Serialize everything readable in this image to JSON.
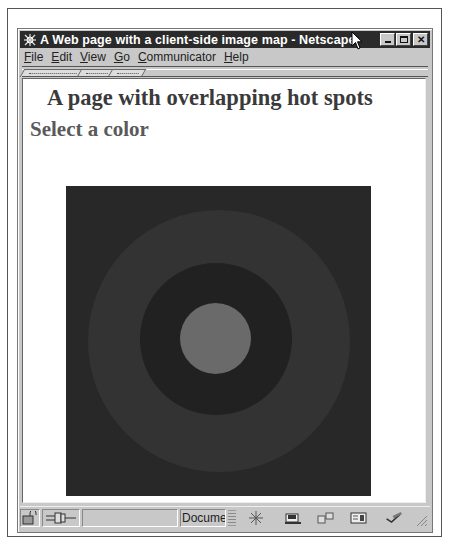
{
  "window": {
    "title": "A Web page with a client-side image map - Netscape",
    "title_icon": "netscape-logo-icon",
    "buttons": {
      "minimize": "_",
      "maximize": "□",
      "close": "✕"
    }
  },
  "menubar": {
    "items": [
      {
        "label": "File",
        "accel": "F",
        "rest": "ile"
      },
      {
        "label": "Edit",
        "accel": "E",
        "rest": "dit"
      },
      {
        "label": "View",
        "accel": "V",
        "rest": "iew"
      },
      {
        "label": "Go",
        "accel": "G",
        "rest": "o"
      },
      {
        "label": "Communicator",
        "accel": "C",
        "rest": "ommunicator"
      },
      {
        "label": "Help",
        "accel": "H",
        "rest": "elp"
      }
    ]
  },
  "toolbar": {
    "collapsed_tabs": 3
  },
  "page": {
    "heading": "A page with overlapping hot spots",
    "subheading": "Select a color",
    "image_map": {
      "background": "#282828",
      "rings": [
        {
          "name": "outer-ring",
          "color": "#333333"
        },
        {
          "name": "middle-ring",
          "color": "#212121"
        },
        {
          "name": "center-circle",
          "color": "#6a6a6a"
        }
      ]
    }
  },
  "statusbar": {
    "status_text": "",
    "progress_label": "Documer",
    "icons": [
      "security-lock-icon",
      "connection-plug-icon",
      "navigator-icon",
      "mailbox-icon",
      "discussion-icon",
      "composer-icon",
      "aim-icon"
    ]
  },
  "colors": {
    "titlebar": "#2a2a2a",
    "chrome": "#c8c8c8",
    "content_bg": "#ffffff"
  }
}
